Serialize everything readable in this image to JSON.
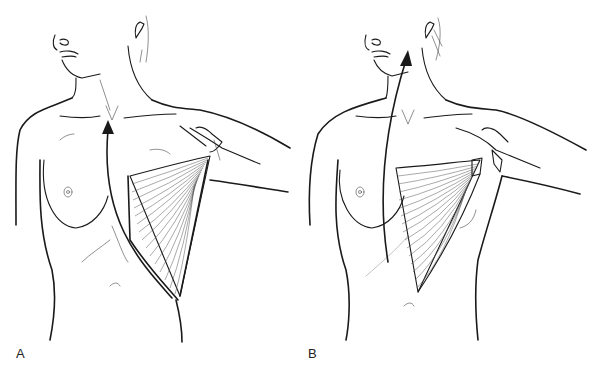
{
  "figure": {
    "background_color": "#ffffff",
    "line_color": "#1a1a1a",
    "panels": [
      {
        "label": "A",
        "description": "Latissimus dorsi muscle elevated on the lateral chest wall; curved arrow indicates rotation toward the sternal notch"
      },
      {
        "label": "B",
        "description": "Latissimus dorsi muscle rotated anteriorly; long arrow indicates transposition upward toward the neck"
      }
    ]
  }
}
